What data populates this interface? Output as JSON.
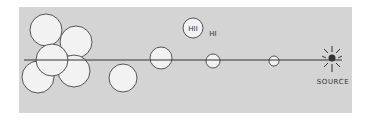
{
  "diagram": {
    "background": "#d4d4d4",
    "line_color": "#333333",
    "bubble_fill": "#f2f2f2",
    "bubble_stroke": "#444444",
    "source_color": "#333333",
    "labels": {
      "hii": "HII",
      "hi": "HI",
      "source": "SOURCE"
    },
    "bubbles": [
      {
        "cx": 46,
        "cy": 30,
        "r": 16
      },
      {
        "cx": 76,
        "cy": 42,
        "r": 16
      },
      {
        "cx": 38,
        "cy": 77,
        "r": 16
      },
      {
        "cx": 74,
        "cy": 71,
        "r": 16
      },
      {
        "cx": 52,
        "cy": 60,
        "r": 16
      },
      {
        "cx": 123,
        "cy": 78,
        "r": 14
      },
      {
        "cx": 161,
        "cy": 58,
        "r": 11
      },
      {
        "cx": 193,
        "cy": 28,
        "r": 10
      },
      {
        "cx": 213,
        "cy": 61,
        "r": 7
      },
      {
        "cx": 274,
        "cy": 61,
        "r": 5
      }
    ]
  }
}
